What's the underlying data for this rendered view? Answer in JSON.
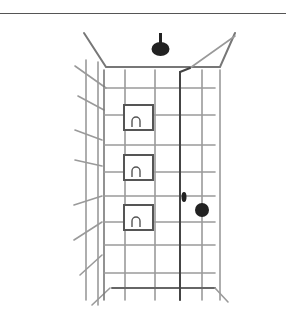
{
  "illustration": {
    "subject": "shower stall with tiled walls, ceiling shower head, three recessed wall niches, valve handle",
    "colors": {
      "line": "#8a8a8a",
      "dark": "#222222",
      "background": "#ffffff"
    },
    "niches": 3
  }
}
